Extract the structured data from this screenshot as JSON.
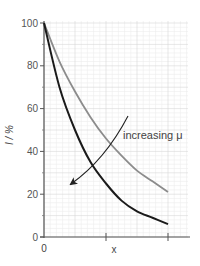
{
  "chart_data": {
    "type": "line",
    "title": "",
    "xlabel": "x",
    "ylabel": "I / %",
    "ylim": [
      0,
      100
    ],
    "xlim": [
      0,
      2.25
    ],
    "yticks": [
      0,
      20,
      40,
      60,
      80,
      100
    ],
    "xticks": [
      0,
      1,
      2
    ],
    "xtick_labels": [
      "0",
      "",
      ""
    ],
    "grid": true,
    "legend": null,
    "x": [
      0,
      0.25,
      0.5,
      0.75,
      1.0,
      1.25,
      1.5,
      1.75,
      2.0
    ],
    "series": [
      {
        "name": "lower μ",
        "color": "#8c8c8c",
        "values": [
          100,
          82,
          68,
          56,
          46,
          38,
          31,
          26,
          21
        ]
      },
      {
        "name": "higher μ",
        "color": "#1a1a1a",
        "values": [
          100,
          70,
          50,
          35,
          25,
          17,
          12,
          9,
          6
        ]
      }
    ],
    "annotations": [
      {
        "text": "increasing μ",
        "arrow_from": [
          1.03,
          56
        ],
        "arrow_to": [
          0.32,
          22
        ]
      }
    ]
  },
  "labels": {
    "y_axis": "I / %",
    "x_axis": "x",
    "annotation": "increasing μ",
    "origin_x": "0",
    "yticks": [
      "100",
      "80",
      "60",
      "40",
      "20",
      "0"
    ]
  }
}
